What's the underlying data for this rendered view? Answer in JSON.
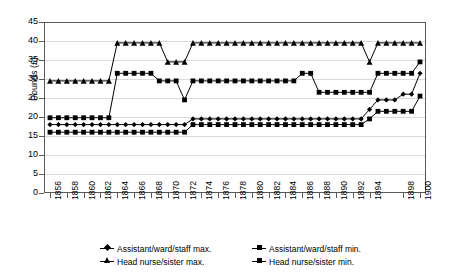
{
  "chart_data": {
    "type": "line",
    "title": "",
    "xlabel": "",
    "ylabel": "Pounds (£)",
    "ylim": [
      0,
      45
    ],
    "ytick_step": 5,
    "ytick_labels": [
      "45",
      "40",
      "35",
      "30",
      "25",
      "20",
      "15",
      "10",
      "5",
      "0"
    ],
    "grid": true,
    "legend_position": "bottom",
    "x": [
      1856,
      1857,
      1858,
      1859,
      1860,
      1861,
      1862,
      1863,
      1864,
      1865,
      1866,
      1867,
      1868,
      1869,
      1870,
      1871,
      1872,
      1873,
      1874,
      1875,
      1876,
      1877,
      1878,
      1879,
      1880,
      1881,
      1882,
      1883,
      1884,
      1885,
      1886,
      1887,
      1888,
      1889,
      1890,
      1891,
      1892,
      1893,
      1894,
      1895,
      1896,
      1897,
      1898,
      1899,
      1900
    ],
    "xtick_labels": [
      "1856",
      "1858",
      "1860",
      "1862",
      "1864",
      "1866",
      "1868",
      "1870",
      "1872",
      "1874",
      "1876",
      "1878",
      "1880",
      "1882",
      "1884",
      "1886",
      "1888",
      "1890",
      "1892",
      "1894",
      "1898",
      "1900"
    ],
    "series": [
      {
        "name": "Assistant/ward/staff max.",
        "marker": "diamond",
        "values": [
          18,
          18,
          18,
          18,
          18,
          18,
          18,
          18,
          18,
          18,
          18,
          18,
          18,
          18,
          18,
          18,
          18,
          19.5,
          19.5,
          19.5,
          19.5,
          19.5,
          19.5,
          19.5,
          19.5,
          19.5,
          19.5,
          19.5,
          19.5,
          19.5,
          19.5,
          19.5,
          19.5,
          19.5,
          19.5,
          19.5,
          19.5,
          19.5,
          22,
          24.5,
          24.5,
          24.5,
          26,
          26,
          31.5
        ]
      },
      {
        "name": "Assistant/ward/staff min.",
        "marker": "square",
        "values": [
          16,
          16,
          16,
          16,
          16,
          16,
          16,
          16,
          16,
          16,
          16,
          16,
          16,
          16,
          16,
          16,
          16,
          18,
          18,
          18,
          18,
          18,
          18,
          18,
          18,
          18,
          18,
          18,
          18,
          18,
          18,
          18,
          18,
          18,
          18,
          18,
          18,
          18,
          19.5,
          21.5,
          21.5,
          21.5,
          21.5,
          21.5,
          25.5
        ]
      },
      {
        "name": "Head nurse/sister max.",
        "marker": "triangle",
        "values": [
          29.5,
          29.5,
          29.5,
          29.5,
          29.5,
          29.5,
          29.5,
          29.5,
          39.5,
          39.5,
          39.5,
          39.5,
          39.5,
          39.5,
          34.5,
          34.5,
          34.5,
          39.5,
          39.5,
          39.5,
          39.5,
          39.5,
          39.5,
          39.5,
          39.5,
          39.5,
          39.5,
          39.5,
          39.5,
          39.5,
          39.5,
          39.5,
          39.5,
          39.5,
          39.5,
          39.5,
          39.5,
          39.5,
          34.5,
          39.5,
          39.5,
          39.5,
          39.5,
          39.5,
          39.5
        ]
      },
      {
        "name": "Head nurse/sister min.",
        "marker": "square",
        "values": [
          19.8,
          19.8,
          19.8,
          19.8,
          19.8,
          19.8,
          19.8,
          19.8,
          31.5,
          31.5,
          31.5,
          31.5,
          31.5,
          29.5,
          29.5,
          29.5,
          24.5,
          29.5,
          29.5,
          29.5,
          29.5,
          29.5,
          29.5,
          29.5,
          29.5,
          29.5,
          29.5,
          29.5,
          29.5,
          29.5,
          31.5,
          31.5,
          26.5,
          26.5,
          26.5,
          26.5,
          26.5,
          26.5,
          26.5,
          31.5,
          31.5,
          31.5,
          31.5,
          31.5,
          34.5
        ]
      }
    ]
  },
  "legend": {
    "items": [
      {
        "label": "Assistant/ward/staff max.",
        "marker": "diamond"
      },
      {
        "label": "Assistant/ward/staff min.",
        "marker": "square"
      },
      {
        "label": "Head nurse/sister max.",
        "marker": "triangle"
      },
      {
        "label": "Head nurse/sister min.",
        "marker": "square"
      }
    ]
  },
  "colors": {
    "series": "#000000",
    "axis": "#595959",
    "grid": "#d9d9d9",
    "background": "#ffffff"
  }
}
